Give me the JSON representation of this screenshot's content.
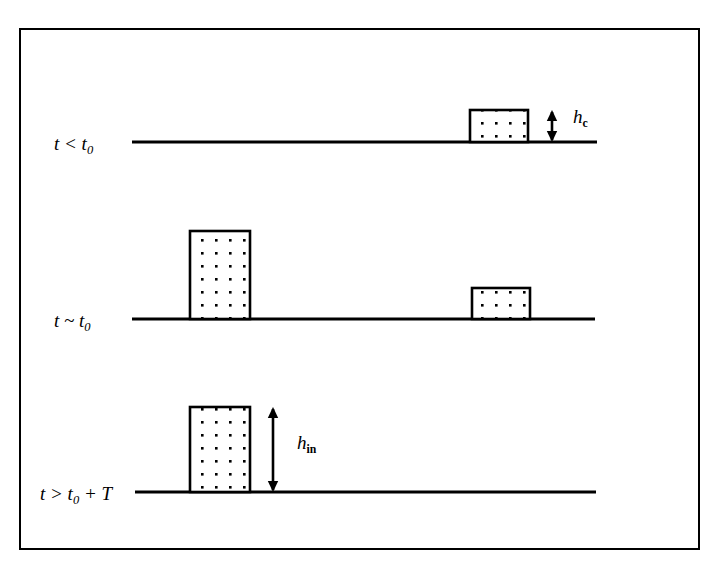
{
  "figure": {
    "background_color": "#ffffff",
    "ink_color": "#000000",
    "frame": {
      "x": 19,
      "y": 28,
      "width": 681,
      "height": 522,
      "stroke_width": 2
    }
  },
  "rows": [
    {
      "id": "row-1",
      "label_text": "t < t",
      "label_sub": "0",
      "label_suffix": "",
      "label_x": 54,
      "label_y": 134,
      "baseline": {
        "x1": 132,
        "x2": 597,
        "y": 142
      },
      "boxes": [
        {
          "id": "box-r1-right",
          "x": 470,
          "y": 110,
          "width": 58,
          "height": 32,
          "dot_cols": 4,
          "dot_rows": 2
        }
      ]
    },
    {
      "id": "row-2",
      "label_text": "t ~ t",
      "label_sub": "0",
      "label_suffix": "",
      "label_x": 54,
      "label_y": 311,
      "baseline": {
        "x1": 132,
        "x2": 595,
        "y": 319
      },
      "boxes": [
        {
          "id": "box-r2-left",
          "x": 190,
          "y": 231,
          "width": 60,
          "height": 88,
          "dot_cols": 4,
          "dot_rows": 7
        },
        {
          "id": "box-r2-right",
          "x": 472,
          "y": 288,
          "width": 58,
          "height": 31,
          "dot_cols": 4,
          "dot_rows": 2
        }
      ]
    },
    {
      "id": "row-3",
      "label_text": "t > t",
      "label_sub": "0",
      "label_suffix": " + T",
      "label_x": 40,
      "label_y": 484,
      "baseline": {
        "x1": 135,
        "x2": 596,
        "y": 492
      },
      "boxes": [
        {
          "id": "box-r3-left",
          "x": 190,
          "y": 407,
          "width": 60,
          "height": 85,
          "dot_cols": 4,
          "dot_rows": 7
        }
      ]
    }
  ],
  "annotations": [
    {
      "id": "hc",
      "symbol": "h",
      "subscript": "c",
      "arrow": {
        "x": 552,
        "y_top": 110,
        "y_bottom": 142
      },
      "label_x": 573,
      "label_y": 107
    },
    {
      "id": "hin",
      "symbol": "h",
      "subscript": "in",
      "arrow": {
        "x": 273,
        "y_top": 407,
        "y_bottom": 492
      },
      "label_x": 297,
      "label_y": 433
    }
  ]
}
